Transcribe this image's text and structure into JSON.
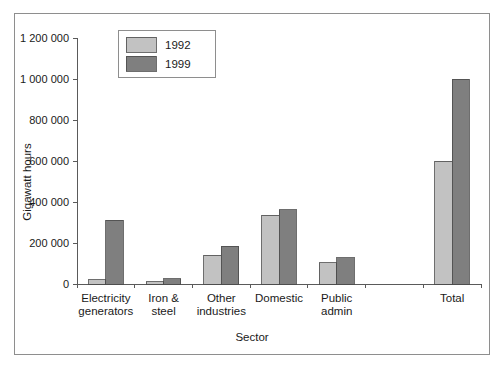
{
  "chart_data": {
    "type": "bar",
    "title": "",
    "xlabel": "Sector",
    "ylabel": "Gigawatt hours",
    "categories": [
      "Electricity generators",
      "Iron & steel",
      "Other industries",
      "Domestic",
      "Public admin",
      "",
      "Total"
    ],
    "category_lines": [
      [
        "Electricity",
        "generators"
      ],
      [
        "Iron &",
        "steel"
      ],
      [
        "Other",
        "industries"
      ],
      [
        "Domestic",
        ""
      ],
      [
        "Public",
        "admin"
      ],
      [
        "",
        ""
      ],
      [
        "Total",
        ""
      ]
    ],
    "series": [
      {
        "name": "1992",
        "color": "#c2c2c2",
        "values": [
          20000,
          12000,
          140000,
          335000,
          103000,
          null,
          600000
        ]
      },
      {
        "name": "1999",
        "color": "#7f7f7f",
        "values": [
          310000,
          25000,
          185000,
          363000,
          127000,
          null,
          1000000
        ]
      }
    ],
    "ylim": [
      0,
      1200000
    ],
    "ytick_values": [
      0,
      200000,
      400000,
      600000,
      800000,
      1000000,
      1200000
    ],
    "ytick_labels": [
      "0",
      "200 000",
      "400 000",
      "600 000",
      "800 000",
      "1 000 000",
      "1 200 000"
    ],
    "grid": false,
    "legend_position": "top-left",
    "legend_entries": [
      {
        "label": "1992",
        "color": "#c2c2c2"
      },
      {
        "label": "1999",
        "color": "#7f7f7f"
      }
    ]
  }
}
